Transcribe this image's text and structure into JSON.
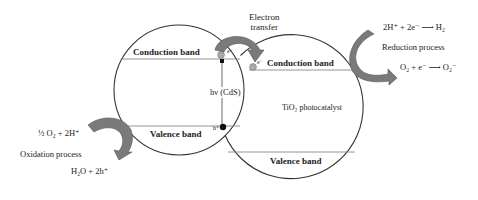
{
  "diagram": {
    "colors": {
      "outline": "#333333",
      "arrow_fill": "#7a7a7a",
      "arrow_stroke": "#555555",
      "electron_fill": "#aaaaaa",
      "hole_fill": "#111111",
      "text": "#222222"
    },
    "cds_particle": {
      "conduction_band": "Conduction band",
      "valence_band": "Valence band",
      "excitation": "hν (CdS)",
      "electron": "e⁻",
      "hole": "h⁺"
    },
    "tio2_particle": {
      "label": "TiO₂ photocatalyst",
      "conduction_band": "Conduction band",
      "valence_band": "Valence band",
      "electron": "e⁻"
    },
    "electron_transfer": {
      "line1": "Electron",
      "line2": "transfer"
    },
    "reduction": {
      "equation1": "2H⁺ + 2e⁻ ⟶ H₂",
      "label": "Reduction process",
      "equation2": "O₂ + e⁻ ⟶ O₂⁻"
    },
    "oxidation": {
      "equation1": "½ O₂ + 2H⁺",
      "label": "Oxidation process",
      "equation2": "H₂O + 2h⁺"
    }
  }
}
